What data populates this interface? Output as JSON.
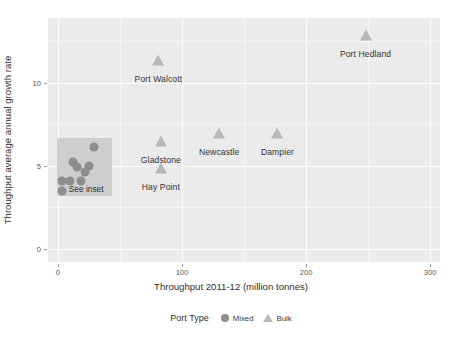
{
  "chart_data": {
    "type": "scatter",
    "title": "",
    "xlabel": "Throughput 2011-12 (million tonnes)",
    "ylabel": "Throughput average annual growth rate",
    "xlim": [
      -8,
      308
    ],
    "ylim": [
      -0.8,
      13.9
    ],
    "xticks": [
      0,
      100,
      200,
      300
    ],
    "yticks": [
      0,
      5,
      10
    ],
    "xtick_labels": [
      "0",
      "100",
      "200",
      "300"
    ],
    "ytick_labels": [
      "0",
      "5",
      "10"
    ],
    "grid": true,
    "legend_position": "bottom",
    "legend_title": "Port Type",
    "series": [
      {
        "name": "Bulk",
        "marker": "triangle",
        "color": "#b8b8b8",
        "points": [
          {
            "label": "Port Hedland",
            "x": 248,
            "y": 12.8,
            "label_dx": 0,
            "label_dy": 13
          },
          {
            "label": "Port Walcott",
            "x": 81,
            "y": 11.3,
            "label_dx": 0,
            "label_dy": 13
          },
          {
            "label": "Gladstone",
            "x": 83,
            "y": 6.4,
            "label_dx": 0,
            "label_dy": 13
          },
          {
            "label": "Hay Point",
            "x": 83,
            "y": 4.8,
            "label_dx": 0,
            "label_dy": 13
          },
          {
            "label": "Newcastle",
            "x": 130,
            "y": 6.9,
            "label_dx": 0,
            "label_dy": 13
          },
          {
            "label": "Dampier",
            "x": 177,
            "y": 6.9,
            "label_dx": 0,
            "label_dy": 13
          }
        ]
      },
      {
        "name": "Mixed",
        "marker": "circle",
        "color": "#8e8e8e",
        "points": [
          {
            "label": "",
            "x": 29,
            "y": 6.1
          },
          {
            "label": "",
            "x": 12,
            "y": 5.2
          },
          {
            "label": "",
            "x": 15,
            "y": 4.9
          },
          {
            "label": "",
            "x": 25,
            "y": 5.0
          },
          {
            "label": "",
            "x": 22,
            "y": 4.6
          },
          {
            "label": "",
            "x": 3,
            "y": 4.1
          },
          {
            "label": "",
            "x": 10,
            "y": 4.1
          },
          {
            "label": "",
            "x": 19,
            "y": 4.1
          },
          {
            "label": "",
            "x": 3,
            "y": 3.5
          }
        ]
      }
    ],
    "annotations": [
      {
        "name": "inset-region",
        "type": "rect",
        "text": "See inset",
        "x0": -1,
        "x1": 44,
        "y0": 3.2,
        "y1": 6.7,
        "fill": "#c9c9c9"
      }
    ]
  },
  "legend": {
    "title": "Port Type",
    "entries": [
      {
        "label": "Mixed",
        "marker": "circle"
      },
      {
        "label": "Bulk",
        "marker": "triangle"
      }
    ]
  }
}
